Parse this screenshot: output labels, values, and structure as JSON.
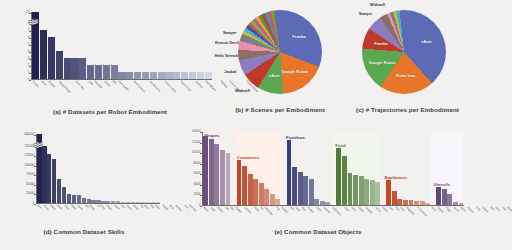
{
  "figure": {
    "background": "#f2f1ef"
  },
  "panels": {
    "a": {
      "caption": "(a) # Datasets per Robot Embodiment",
      "ylim": [
        0,
        8
      ],
      "yticks": [
        "0",
        "1",
        "2",
        "3",
        "4",
        "5",
        "6",
        "7",
        "8"
      ],
      "break_tick": "25",
      "accent": "#2a2a6a"
    },
    "b": {
      "caption": "(b) # Scenes per Embodiment"
    },
    "c": {
      "caption": "(c) # Trajectories per Embodiment"
    },
    "d": {
      "caption": "(d) Common Dataset Skills",
      "yticks": [
        "0",
        "25000",
        "50000",
        "75000",
        "100000",
        "125000",
        "150000"
      ],
      "break_tick": "400000",
      "accent": "#232352"
    },
    "e": {
      "caption": "(e) Common Dataset Objects",
      "yticks": [
        "0",
        "2000",
        "4000",
        "6000",
        "8000",
        "10000",
        "12000",
        "14000"
      ]
    }
  },
  "chart_data": [
    {
      "id": "a",
      "type": "bar",
      "title": "(a) # Datasets per Robot Embodiment",
      "xlabel": "",
      "ylabel": "",
      "ylim": [
        0,
        8
      ],
      "axis_break": {
        "above": 8,
        "top_value": 25
      },
      "yticks": [
        0,
        1,
        2,
        3,
        4,
        5,
        6,
        7,
        8,
        25
      ],
      "grid": false,
      "categories": [
        "Franka",
        "xArm",
        "Sawyer",
        "Google Robot",
        "Kuka iiwa",
        "UR5",
        "WidowX",
        "Jackal",
        "PR2",
        "DLR SARA",
        "Hello Stretch",
        "Universal x1",
        "Kinova Gen3",
        "Fanuc Mate",
        "Cobotta",
        "DLR EDAN",
        "PANDA",
        "Kinova Gen2",
        "Fanuc Robot",
        "Nextage",
        "KC Cart",
        "RoboNet2",
        "Robotiq"
      ],
      "values": [
        25,
        7,
        6,
        4,
        3,
        3,
        3,
        2,
        2,
        2,
        2,
        1,
        1,
        1,
        1,
        1,
        1,
        1,
        1,
        1,
        1,
        1,
        1
      ],
      "bar_colors_note": "gradient dark navy (#221f52) to pale steel blue (#cdd8e8)"
    },
    {
      "id": "b",
      "type": "pie",
      "title": "(b) # Scenes per Embodiment",
      "labels": [
        "Franka",
        "Google Robot",
        "xArm",
        "WidowX",
        "Jackal",
        "Hello Stretch",
        "Kinova Gen3",
        "Sawyer"
      ],
      "values": [
        33,
        18,
        10,
        7,
        6,
        4,
        3.5,
        3
      ],
      "other_slices": 15.5,
      "legend": "none (labels on/near slices)"
    },
    {
      "id": "c",
      "type": "pie",
      "title": "(c) # Trajectories per Embodiment",
      "labels": [
        "xArm",
        "Kuka iiwa",
        "Google Robot",
        "Franka",
        "Sawyer",
        "WidowX"
      ],
      "values": [
        40,
        21,
        17,
        8,
        6,
        3
      ],
      "other_slices": 5,
      "legend": "none (labels on/near slices)"
    },
    {
      "id": "d",
      "type": "bar",
      "title": "(d) Common Dataset Skills",
      "xlabel": "",
      "ylabel": "",
      "ylim": [
        0,
        150000
      ],
      "axis_break": {
        "above": 150000,
        "top_value": 400000
      },
      "yticks": [
        0,
        25000,
        50000,
        75000,
        100000,
        125000,
        150000,
        400000
      ],
      "grid": false,
      "categories": [
        "pick",
        "move",
        "place",
        "push",
        "close",
        "open",
        "reach",
        "put",
        "grasp",
        "lift",
        "slide",
        "rotate",
        "stack",
        "pull",
        "insert",
        "press",
        "flip",
        "pour",
        "fold",
        "wipe",
        "knock",
        "twist",
        "sweep",
        "turn",
        "pull out"
      ],
      "values": [
        400000,
        148000,
        128000,
        114000,
        64000,
        41000,
        24000,
        22000,
        20000,
        12000,
        10000,
        9000,
        8000,
        6500,
        5500,
        5000,
        4200,
        3500,
        3000,
        2600,
        2200,
        1900,
        1600,
        1300,
        1000
      ],
      "bar_colors_note": "gradient dark navy (#232352) to pale steel blue (#c9d4e6)"
    },
    {
      "id": "e",
      "type": "bar",
      "title": "(e) Common Dataset Objects",
      "xlabel": "",
      "ylabel": "",
      "ylim": [
        0,
        14000
      ],
      "yticks": [
        0,
        2000,
        4000,
        6000,
        8000,
        10000,
        12000,
        14000
      ],
      "grid": false,
      "groups": [
        {
          "name": "Shapes",
          "color": "#6b4f7a",
          "band": "#f6f2f7",
          "categories": [
            "block",
            "cube",
            "object",
            "ball",
            "box"
          ],
          "values": [
            13000,
            12500,
            11600,
            10400,
            9800
          ]
        },
        {
          "name": "Containers",
          "color": "#c0452a",
          "band": "#fdf1ea",
          "categories": [
            "drawer",
            "cabinet",
            "bowl",
            "bin",
            "container",
            "tray",
            "basket",
            "pot"
          ],
          "values": [
            8500,
            7400,
            5800,
            5000,
            4100,
            3000,
            2100,
            1200
          ]
        },
        {
          "name": "Furniture",
          "color": "#3b3f78",
          "band": "#f2f3f8",
          "categories": [
            "table",
            "door",
            "drawer",
            "shelf",
            "counter",
            "cupboard",
            "desk",
            "chair"
          ],
          "values": [
            12300,
            7200,
            6200,
            5400,
            5000,
            1100,
            800,
            500
          ]
        },
        {
          "name": "Food",
          "color": "#4f7a3a",
          "band": "#f2f7ee",
          "categories": [
            "apple",
            "banana",
            "carrot",
            "bottle",
            "can",
            "fruit",
            "corn",
            "eggplant"
          ],
          "values": [
            10700,
            9200,
            6100,
            5700,
            5400,
            5000,
            4700,
            4400
          ]
        },
        {
          "name": "Appliances",
          "color": "#c04a22",
          "band": "#fdf7e8",
          "categories": [
            "microwave",
            "oven",
            "faucet",
            "fridge",
            "stove",
            "kettle",
            "toaster",
            "sink"
          ],
          "values": [
            4700,
            2700,
            1200,
            1000,
            900,
            800,
            700,
            400
          ]
        },
        {
          "name": "Utensils",
          "color": "#5b4a7a",
          "band": "#f7f5f9",
          "categories": [
            "spoon",
            "fork",
            "knife",
            "cup",
            "plate"
          ],
          "values": [
            3500,
            3100,
            2000,
            600,
            300
          ]
        }
      ]
    }
  ]
}
